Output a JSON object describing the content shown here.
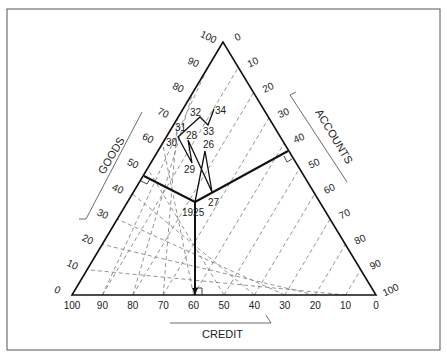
{
  "figure": {
    "type": "ternary",
    "axes": {
      "goods": {
        "label": "GOODS",
        "ticks": [
          "0",
          "10",
          "20",
          "30",
          "40",
          "50",
          "60",
          "70",
          "80",
          "90",
          "100"
        ]
      },
      "accounts": {
        "label": "ACCOUNTS",
        "ticks": [
          "0",
          "10",
          "20",
          "30",
          "40",
          "50",
          "60",
          "70",
          "80",
          "90",
          "100"
        ]
      },
      "credit": {
        "label": "CREDIT",
        "ticks": [
          "100",
          "90",
          "80",
          "70",
          "60",
          "50",
          "40",
          "30",
          "20",
          "10",
          "0"
        ]
      }
    },
    "path_labels": [
      "1925",
      "26",
      "27",
      "28",
      "29",
      "30",
      "31",
      "32",
      "33",
      "34"
    ]
  },
  "chart_data": {
    "type": "ternary-path",
    "title": "",
    "axes": [
      "GOODS",
      "ACCOUNTS",
      "CREDIT"
    ],
    "axis_range": [
      0,
      100
    ],
    "grid": "dashed every 10",
    "series": [
      {
        "name": "trajectory",
        "points": [
          {
            "label": "1925",
            "credit": 60,
            "goods": 35,
            "accounts": 5
          },
          {
            "label": "26",
            "credit": 46,
            "goods": 55,
            "accounts": -1
          },
          {
            "label": "27",
            "credit": 50,
            "goods": 40,
            "accounts": 10
          },
          {
            "label": "28",
            "credit": 53,
            "goods": 60,
            "accounts": -13
          },
          {
            "label": "29",
            "credit": 55,
            "goods": 52,
            "accounts": -7
          },
          {
            "label": "30",
            "credit": 57,
            "goods": 62,
            "accounts": -19
          },
          {
            "label": "31",
            "credit": 53,
            "goods": 66,
            "accounts": -19
          },
          {
            "label": "32",
            "credit": 48,
            "goods": 70,
            "accounts": -18
          },
          {
            "label": "33",
            "credit": 46,
            "goods": 67,
            "accounts": -13
          },
          {
            "label": "34",
            "credit": 40,
            "goods": 73,
            "accounts": -13
          }
        ]
      }
    ],
    "perpendiculars_from": "1925",
    "annotations": [
      "right-angle markers at perpendicular feet on each side"
    ]
  }
}
